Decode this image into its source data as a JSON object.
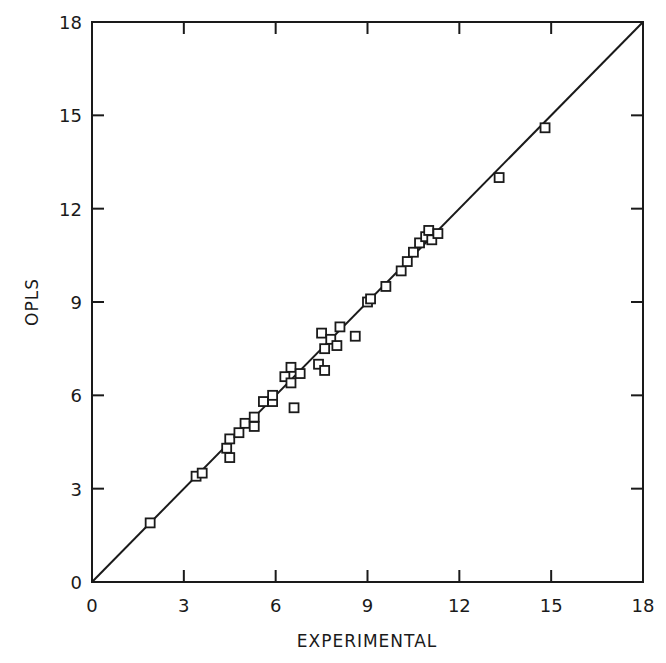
{
  "chart_data": {
    "type": "scatter",
    "title": "",
    "xlabel": "EXPERIMENTAL",
    "ylabel": "OPLS",
    "xlim": [
      0,
      18
    ],
    "ylim": [
      0,
      18
    ],
    "xticks": [
      0,
      3,
      6,
      9,
      12,
      15,
      18
    ],
    "yticks": [
      0,
      3,
      6,
      9,
      12,
      15,
      18
    ],
    "grid": false,
    "legend": null,
    "marker": "open-square",
    "reference_line": {
      "type": "y=x",
      "from": [
        0,
        0
      ],
      "to": [
        18,
        18
      ]
    },
    "series": [
      {
        "name": "OPLS vs Experimental",
        "points": [
          [
            1.9,
            1.9
          ],
          [
            3.4,
            3.4
          ],
          [
            3.6,
            3.5
          ],
          [
            4.4,
            4.3
          ],
          [
            4.5,
            4.6
          ],
          [
            4.5,
            4.0
          ],
          [
            4.8,
            4.8
          ],
          [
            5.0,
            5.1
          ],
          [
            5.3,
            5.0
          ],
          [
            5.3,
            5.3
          ],
          [
            5.6,
            5.8
          ],
          [
            5.9,
            5.8
          ],
          [
            5.9,
            6.0
          ],
          [
            6.3,
            6.6
          ],
          [
            6.5,
            6.4
          ],
          [
            6.5,
            6.9
          ],
          [
            6.8,
            6.7
          ],
          [
            6.6,
            5.6
          ],
          [
            7.4,
            7.0
          ],
          [
            7.5,
            8.0
          ],
          [
            7.6,
            6.8
          ],
          [
            7.6,
            7.5
          ],
          [
            7.8,
            7.8
          ],
          [
            8.0,
            7.6
          ],
          [
            8.1,
            8.2
          ],
          [
            8.6,
            7.9
          ],
          [
            9.0,
            9.0
          ],
          [
            9.1,
            9.1
          ],
          [
            9.6,
            9.5
          ],
          [
            10.1,
            10.0
          ],
          [
            10.3,
            10.3
          ],
          [
            10.5,
            10.6
          ],
          [
            10.7,
            10.9
          ],
          [
            10.9,
            11.1
          ],
          [
            11.0,
            11.3
          ],
          [
            11.1,
            11.0
          ],
          [
            11.3,
            11.2
          ],
          [
            13.3,
            13.0
          ],
          [
            14.8,
            14.6
          ]
        ]
      }
    ]
  },
  "labels": {
    "x_axis_title": "EXPERIMENTAL",
    "y_axis_title": "OPLS",
    "x_ticks": [
      "0",
      "3",
      "6",
      "9",
      "12",
      "15",
      "18"
    ],
    "y_ticks": [
      "0",
      "3",
      "6",
      "9",
      "12",
      "15",
      "18"
    ]
  },
  "colors": {
    "ink": "#1a1a1a",
    "background": "#ffffff"
  }
}
